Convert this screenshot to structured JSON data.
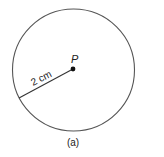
{
  "figure": {
    "center_label": "P",
    "radius_label": "2 cm",
    "caption": "(a)",
    "stroke_color": "#555555",
    "point_color": "#111111"
  }
}
